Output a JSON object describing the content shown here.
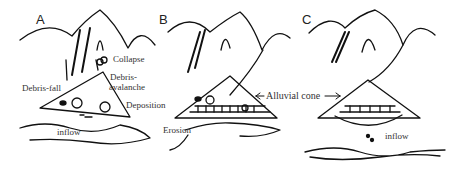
{
  "panels": [
    {
      "id": "A",
      "labels": {
        "collapse": "Collapse",
        "debris_avalanche_1": "Debris-",
        "debris_avalanche_2": "avalanche",
        "debris_fall": "Debris-fall",
        "deposition": "Deposition",
        "inflow": "inflow"
      }
    },
    {
      "id": "B",
      "labels": {
        "erosion": "Erosion"
      }
    },
    {
      "id": "C",
      "labels": {
        "inflow": "inflow"
      }
    }
  ],
  "shared_labels": {
    "alluvial_cone": "Alluvial cone"
  },
  "colors": {
    "stroke": "#111111",
    "text": "#333333",
    "background": "#ffffff"
  }
}
